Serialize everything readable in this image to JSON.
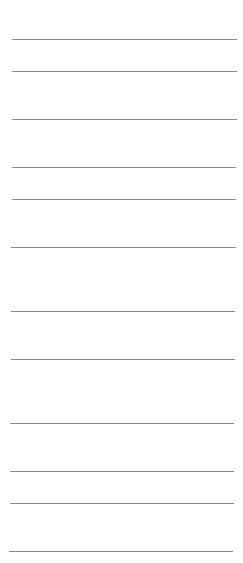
{
  "page": {
    "background": "#ffffff",
    "line_color": "#8a8a8a",
    "ruled_lines": [
      {
        "y": 39,
        "x1": 12,
        "x2": 237
      },
      {
        "y": 71,
        "x1": 12,
        "x2": 237
      },
      {
        "y": 119,
        "x1": 12,
        "x2": 237
      },
      {
        "y": 167,
        "x1": 12,
        "x2": 236
      },
      {
        "y": 199,
        "x1": 12,
        "x2": 236
      },
      {
        "y": 247,
        "x1": 11,
        "x2": 236
      },
      {
        "y": 311,
        "x1": 11,
        "x2": 235
      },
      {
        "y": 359,
        "x1": 11,
        "x2": 235
      },
      {
        "y": 423,
        "x1": 10,
        "x2": 234
      },
      {
        "y": 471,
        "x1": 10,
        "x2": 234
      },
      {
        "y": 503,
        "x1": 10,
        "x2": 234
      },
      {
        "y": 551,
        "x1": 9,
        "x2": 233
      }
    ]
  }
}
